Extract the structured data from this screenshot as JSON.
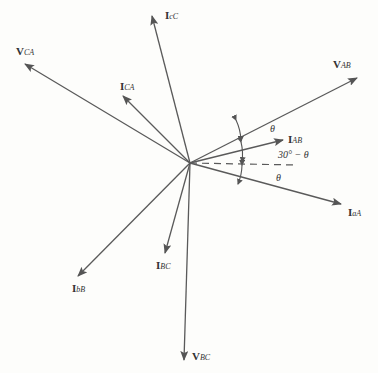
{
  "diagram": {
    "type": "phasor-diagram",
    "origin": [
      190,
      163
    ],
    "color": "#555555",
    "phasors": [
      {
        "id": "V_AB",
        "main": "V",
        "sub": "AB",
        "tip": [
          357,
          78
        ],
        "label_pos": [
          333,
          58
        ]
      },
      {
        "id": "I_AB",
        "main": "I",
        "sub": "AB",
        "tip": [
          283,
          140
        ],
        "label_pos": [
          288,
          133
        ]
      },
      {
        "id": "I_aA",
        "main": "I",
        "sub": "aA",
        "tip": [
          341,
          204
        ],
        "label_pos": [
          348,
          206
        ]
      },
      {
        "id": "V_CA",
        "main": "V",
        "sub": "CA",
        "tip": [
          25,
          64
        ],
        "label_pos": [
          16,
          45
        ]
      },
      {
        "id": "I_CA",
        "main": "I",
        "sub": "CA",
        "tip": [
          123,
          96
        ],
        "label_pos": [
          120,
          80
        ]
      },
      {
        "id": "I_cC",
        "main": "I",
        "sub": "cC",
        "tip": [
          152,
          16
        ],
        "label_pos": [
          165,
          9
        ]
      },
      {
        "id": "I_bB",
        "main": "I",
        "sub": "bB",
        "tip": [
          78,
          276
        ],
        "label_pos": [
          72,
          282
        ]
      },
      {
        "id": "I_BC",
        "main": "I",
        "sub": "BC",
        "tip": [
          165,
          253
        ],
        "label_pos": [
          156,
          259
        ]
      },
      {
        "id": "V_BC",
        "main": "V",
        "sub": "BC",
        "tip": [
          184,
          360
        ],
        "label_pos": [
          192,
          350
        ]
      }
    ],
    "reference_line": {
      "style": "dashed",
      "from": [
        190,
        163
      ],
      "to": [
        296,
        165
      ]
    },
    "angles": [
      {
        "text": "θ",
        "pos": [
          270,
          123
        ]
      },
      {
        "text": "30° − θ",
        "pos": [
          278,
          149
        ]
      },
      {
        "text": "θ",
        "pos": [
          276,
          172
        ]
      }
    ]
  }
}
